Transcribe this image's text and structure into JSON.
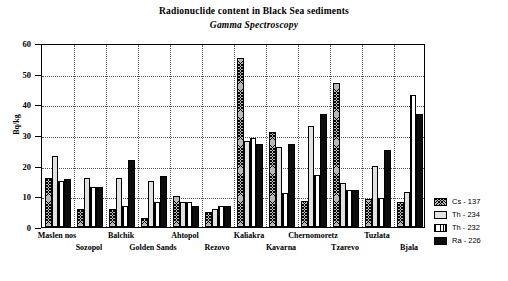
{
  "chart_data": {
    "type": "bar",
    "title": "Radionuclide content in Black Sea sediments",
    "subtitle": "Gamma Spectroscopy",
    "xlabel": "",
    "ylabel": "Bq/kg",
    "ylim": [
      0,
      60
    ],
    "yticks": [
      0,
      10,
      20,
      30,
      40,
      50,
      60
    ],
    "grid": true,
    "legend_position": "right-bottom",
    "categories": [
      "Maslen nos",
      "Sozopol",
      "Balchik",
      "Golden Sands",
      "Ahtopol",
      "Rezovo",
      "Kaliakra",
      "Kavarna",
      "Chernomoretz",
      "Tzarevo",
      "Tuzlata",
      "Bjala"
    ],
    "series": [
      {
        "name": "Cs - 137",
        "pattern": "crosshatch",
        "color": "#b9b9b9",
        "values": [
          16,
          6,
          6,
          3,
          10,
          5,
          55,
          31,
          8.5,
          47,
          9,
          8
        ]
      },
      {
        "name": "Th - 234",
        "pattern": "light-solid",
        "color": "#e2e2e2",
        "values": [
          23,
          16,
          16,
          15,
          8,
          6,
          28,
          26,
          33,
          14.5,
          20,
          11.5
        ]
      },
      {
        "name": "Th - 232",
        "pattern": "vertical-stripes",
        "color": "#ffffff",
        "values": [
          15,
          13,
          7,
          8,
          8,
          7,
          29,
          11,
          17,
          12,
          9.5,
          43
        ]
      },
      {
        "name": "Ra - 226",
        "pattern": "solid-black",
        "color": "#0d0d0d",
        "values": [
          15.5,
          13,
          22,
          16.5,
          7,
          7,
          27,
          27,
          37,
          12,
          25,
          37
        ]
      }
    ]
  },
  "legend": {
    "items": [
      {
        "label": "Cs - 137"
      },
      {
        "label": "Th - 234"
      },
      {
        "label": "Th - 232"
      },
      {
        "label": "Ra - 226"
      }
    ]
  }
}
